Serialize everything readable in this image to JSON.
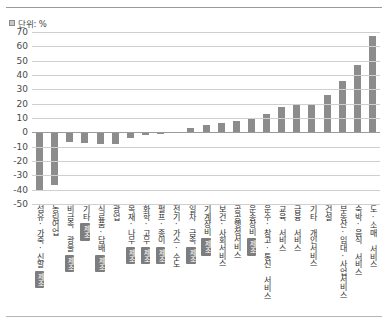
{
  "unit_note": "단위: %",
  "chart_data": {
    "type": "bar",
    "title": "",
    "subtitle": "",
    "xlabel": "",
    "ylabel": "",
    "unit": "%",
    "ylim": [
      -50,
      70
    ],
    "ytick_step": 10,
    "yticks": [
      "70",
      "60",
      "50",
      "40",
      "30",
      "20",
      "10",
      "0",
      "-10",
      "-20",
      "-30",
      "-40",
      "-50"
    ],
    "grid": true,
    "legend": false,
    "bar_color": "#8c8c8c",
    "categories": [
      "섬유·가죽·신발",
      "농림어업",
      "비금속 광물",
      "기타",
      "식료품·담배",
      "광업",
      "목재·나무",
      "화학·고무",
      "펄프·종이",
      "전기·가스·수도",
      "일차 금속",
      "기계장비",
      "보건·사회서비스",
      "공공행정서비스",
      "운송장비",
      "운수·창고·통신 서비스",
      "교육 서비스",
      "금융 서비스",
      "기타 개인서비스",
      "건설",
      "부동산·임대·사업서비스",
      "숙박·음식 서비스",
      "도·소매 서비스"
    ],
    "badges": [
      "제조",
      "",
      "제조",
      "제조",
      "제조",
      "",
      "제조",
      "제조",
      "제조",
      "",
      "제조",
      "제조",
      "",
      "",
      "제조",
      "",
      "",
      "",
      "",
      "",
      "",
      "",
      ""
    ],
    "badge_label": "제조",
    "values": [
      -40.0,
      -37.0,
      -7.0,
      -7.5,
      -8.0,
      -8.0,
      -4.0,
      -2.0,
      -1.0,
      0.5,
      3.0,
      5.0,
      6.5,
      8.0,
      9.0,
      13.0,
      17.5,
      19.0,
      20.0,
      26.0,
      36.0,
      47.0,
      67.5
    ]
  }
}
